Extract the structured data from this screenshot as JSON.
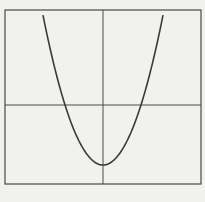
{
  "chart_data": {
    "type": "line",
    "title": "",
    "xlabel": "",
    "ylabel": "",
    "function": "y = x^2 - 4",
    "xlim": [
      -5.2,
      5.1
    ],
    "ylim": [
      -5.3,
      6.3
    ],
    "grid": false,
    "axes_through_origin": true,
    "series": [
      {
        "name": "parabola",
        "x": [
          -3.16,
          -3,
          -2.5,
          -2,
          -1.5,
          -1,
          -0.5,
          0,
          0.5,
          1,
          1.5,
          2,
          2.5,
          3,
          3.16
        ],
        "y": [
          6.0,
          5.0,
          2.25,
          0,
          -1.75,
          -3,
          -3.75,
          -4,
          -3.75,
          -3,
          -1.75,
          0,
          2.25,
          5.0,
          6.0
        ]
      }
    ],
    "vertex": [
      0,
      -4
    ],
    "x_intercepts": [
      -2,
      2
    ],
    "legend": null
  },
  "colors": {
    "background": "#f1f1ee",
    "curve": "#3a3a3a",
    "axes": "#4a4a4a",
    "frame": "#4a4a4a"
  },
  "caption": ""
}
